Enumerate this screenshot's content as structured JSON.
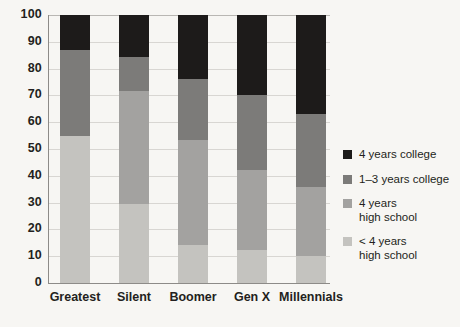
{
  "chart_data": {
    "type": "bar",
    "subtype": "stacked-bar-100",
    "title": "",
    "subtitle": "",
    "xlabel": "",
    "ylabel": "",
    "categories": [
      "Greatest",
      "Silent",
      "Boomer",
      "Gen X",
      "Millennials"
    ],
    "ylim": [
      0,
      100
    ],
    "yticks": [
      0,
      10,
      20,
      30,
      40,
      50,
      60,
      70,
      80,
      90,
      100
    ],
    "ytick_labels": [
      "0",
      "10",
      "20",
      "30",
      "40",
      "50",
      "60",
      "70",
      "80",
      "90",
      "100"
    ],
    "grid": true,
    "legend_position": "right",
    "series": [
      {
        "name": "< 4 years\nhigh school",
        "color": "#c4c3bf",
        "values": [
          55,
          29.5,
          14,
          12.5,
          10
        ]
      },
      {
        "name": "4 years\nhigh school",
        "color": "#a3a2a0",
        "values": [
          0,
          42,
          39.5,
          29.5,
          26
        ]
      },
      {
        "name": "1–3 years college",
        "color": "#7c7b79",
        "values": [
          32,
          13,
          22.5,
          28,
          27
        ]
      },
      {
        "name": "4 years college",
        "color": "#1d1b1a",
        "values": [
          13,
          15.5,
          24,
          30,
          37
        ]
      }
    ],
    "stack_totals": [
      100,
      100,
      100,
      100,
      100
    ]
  },
  "axes": {
    "y_labels": [
      "100",
      "90",
      "80",
      "70",
      "60",
      "50",
      "40",
      "30",
      "20",
      "10",
      "0"
    ],
    "x_labels": [
      "Greatest",
      "Silent",
      "Boomer",
      "Gen X",
      "Millennials"
    ]
  },
  "legend": {
    "items": [
      {
        "label": "4 years college",
        "color": "#1d1b1a"
      },
      {
        "label": "1–3 years college",
        "color": "#7c7b79"
      },
      {
        "label": "4 years\nhigh school",
        "color": "#a3a2a0"
      },
      {
        "label": "< 4 years\nhigh school",
        "color": "#c4c3bf"
      }
    ]
  }
}
